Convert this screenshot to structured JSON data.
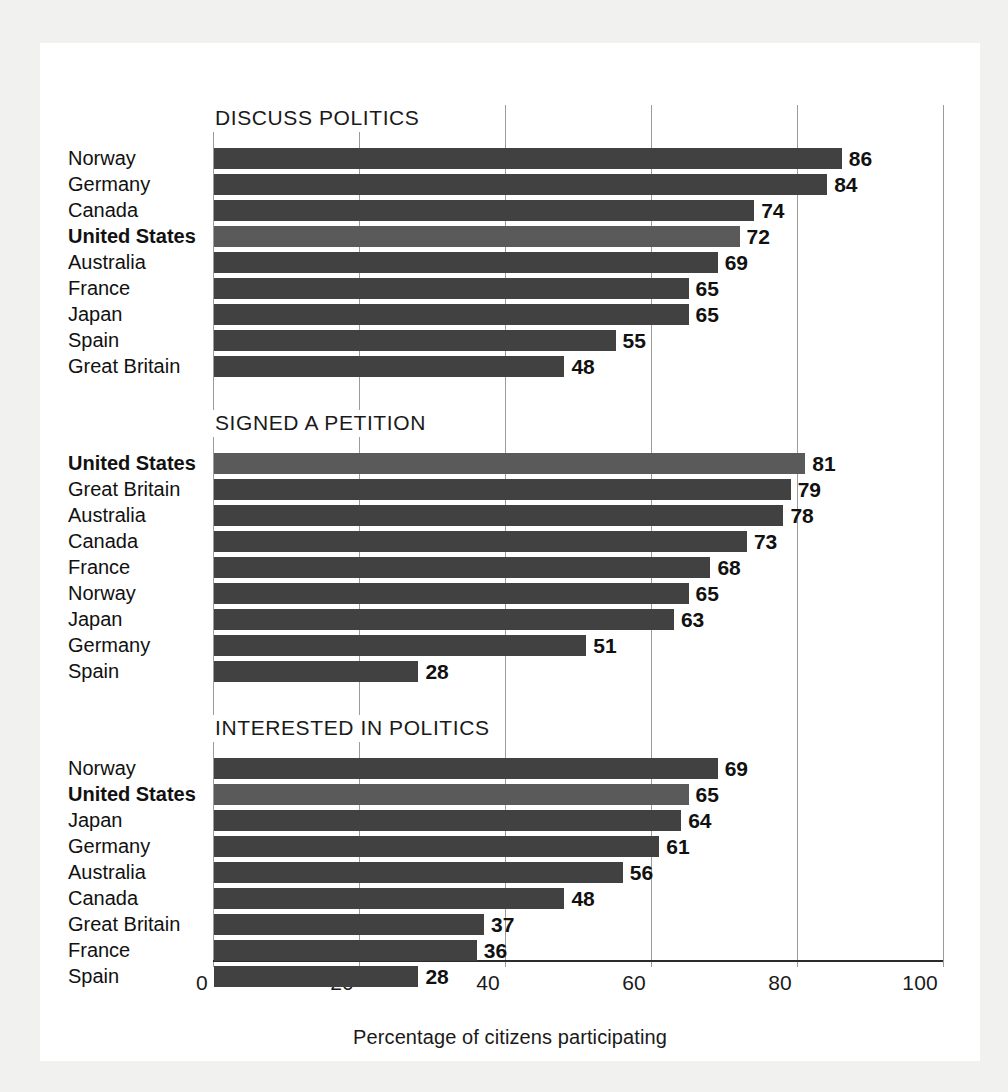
{
  "axis": {
    "caption": "Percentage of citizens participating",
    "ticks": [
      "0",
      "20",
      "40",
      "60",
      "80",
      "100"
    ]
  },
  "colors": {
    "bar": "#414141",
    "bar_highlight": "#5a5a5a",
    "gridline": "#9b9b9b",
    "card_background": "#ffffff",
    "page_background": "#f1f1f0",
    "text": "#111111"
  },
  "panels": [
    {
      "title": "DISCUSS POLITICS",
      "rows": [
        {
          "label": "Norway",
          "value": "86",
          "highlight": false
        },
        {
          "label": "Germany",
          "value": "84",
          "highlight": false
        },
        {
          "label": "Canada",
          "value": "74",
          "highlight": false
        },
        {
          "label": "United States",
          "value": "72",
          "highlight": true
        },
        {
          "label": "Australia",
          "value": "69",
          "highlight": false
        },
        {
          "label": "France",
          "value": "65",
          "highlight": false
        },
        {
          "label": "Japan",
          "value": "65",
          "highlight": false
        },
        {
          "label": "Spain",
          "value": "55",
          "highlight": false
        },
        {
          "label": "Great Britain",
          "value": "48",
          "highlight": false
        }
      ]
    },
    {
      "title": "SIGNED A PETITION",
      "rows": [
        {
          "label": "United States",
          "value": "81",
          "highlight": true
        },
        {
          "label": "Great Britain",
          "value": "79",
          "highlight": false
        },
        {
          "label": "Australia",
          "value": "78",
          "highlight": false
        },
        {
          "label": "Canada",
          "value": "73",
          "highlight": false
        },
        {
          "label": "France",
          "value": "68",
          "highlight": false
        },
        {
          "label": "Norway",
          "value": "65",
          "highlight": false
        },
        {
          "label": "Japan",
          "value": "63",
          "highlight": false
        },
        {
          "label": "Germany",
          "value": "51",
          "highlight": false
        },
        {
          "label": "Spain",
          "value": "28",
          "highlight": false
        }
      ]
    },
    {
      "title": "INTERESTED IN POLITICS",
      "rows": [
        {
          "label": "Norway",
          "value": "69",
          "highlight": false
        },
        {
          "label": "United States",
          "value": "65",
          "highlight": true
        },
        {
          "label": "Japan",
          "value": "64",
          "highlight": false
        },
        {
          "label": "Germany",
          "value": "61",
          "highlight": false
        },
        {
          "label": "Australia",
          "value": "56",
          "highlight": false
        },
        {
          "label": "Canada",
          "value": "48",
          "highlight": false
        },
        {
          "label": "Great Britain",
          "value": "37",
          "highlight": false
        },
        {
          "label": "France",
          "value": "36",
          "highlight": false
        },
        {
          "label": "Spain",
          "value": "28",
          "highlight": false
        }
      ]
    }
  ],
  "chart_data": {
    "type": "bar",
    "orientation": "horizontal",
    "title": "",
    "xlabel": "Percentage of citizens participating",
    "ylabel": "",
    "xlim": [
      0,
      100
    ],
    "xticks": [
      0,
      20,
      40,
      60,
      80,
      100
    ],
    "grid": true,
    "legend": "none",
    "highlight_category": "United States",
    "panels": [
      {
        "title": "DISCUSS POLITICS",
        "categories": [
          "Norway",
          "Germany",
          "Canada",
          "United States",
          "Australia",
          "France",
          "Japan",
          "Spain",
          "Great Britain"
        ],
        "values": [
          86,
          84,
          74,
          72,
          69,
          65,
          65,
          55,
          48
        ]
      },
      {
        "title": "SIGNED A PETITION",
        "categories": [
          "United States",
          "Great Britain",
          "Australia",
          "Canada",
          "France",
          "Norway",
          "Japan",
          "Germany",
          "Spain"
        ],
        "values": [
          81,
          79,
          78,
          73,
          68,
          65,
          63,
          51,
          28
        ]
      },
      {
        "title": "INTERESTED IN POLITICS",
        "categories": [
          "Norway",
          "United States",
          "Japan",
          "Germany",
          "Australia",
          "Canada",
          "Great Britain",
          "France",
          "Spain"
        ],
        "values": [
          69,
          65,
          64,
          61,
          56,
          48,
          37,
          36,
          28
        ]
      }
    ]
  }
}
